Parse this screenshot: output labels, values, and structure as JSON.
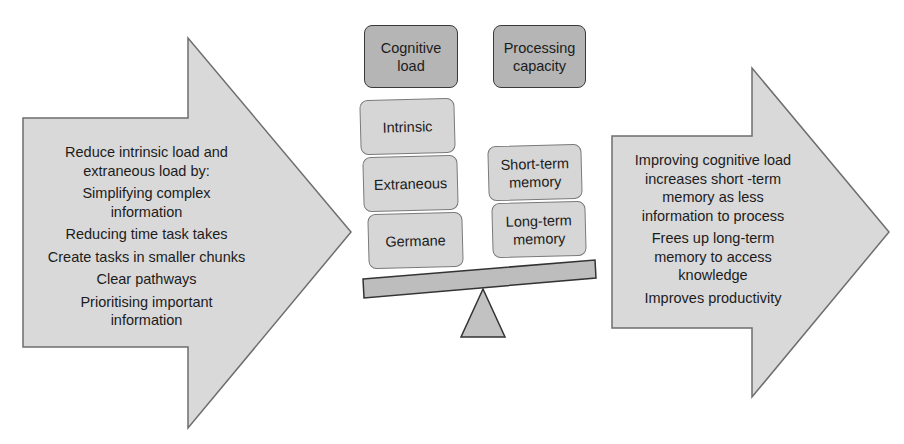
{
  "left_arrow": {
    "heading": "Reduce intrinsic load and extraneous load by:",
    "items": [
      "Simplifying complex information",
      "Reducing time task takes",
      "Create tasks in smaller chunks",
      "Clear pathways",
      "Prioritising important information"
    ]
  },
  "balance": {
    "left_header": "Cognitive load",
    "right_header": "Processing capacity",
    "left_items": [
      "Intrinsic",
      "Extraneous",
      "Germane"
    ],
    "right_items": [
      "Short-term memory",
      "Long-term memory"
    ]
  },
  "right_arrow": {
    "items": [
      "Improving cognitive load increases short -term memory as less information to process",
      "Frees up long-term memory to access knowledge",
      "Improves productivity"
    ]
  },
  "colors": {
    "arrow_fill": "#d9d9d9",
    "arrow_stroke": "#6e6e6e",
    "header_fill": "#b5b5b5",
    "item_fill": "#d6d6d6",
    "beam_fill": "#bdbdbd"
  }
}
